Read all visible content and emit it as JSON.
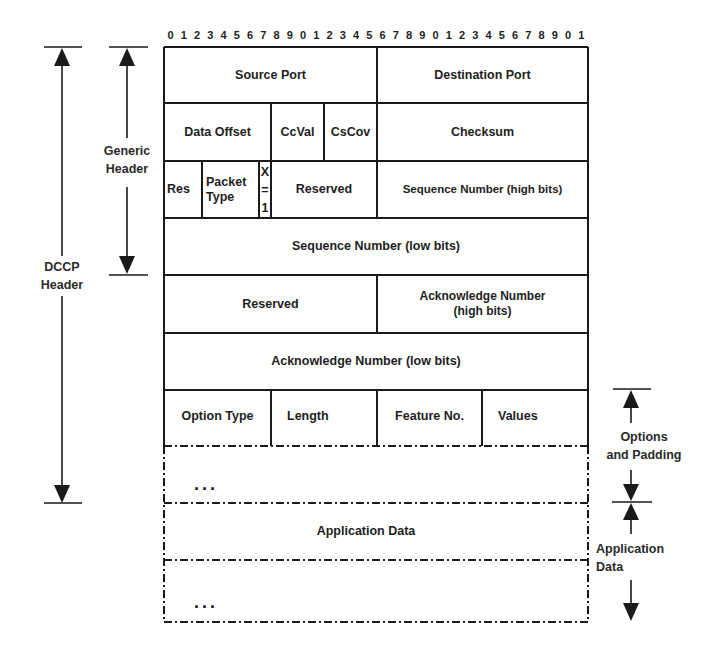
{
  "diagram": {
    "bit_ruler": [
      "0",
      "1",
      "2",
      "3",
      "4",
      "5",
      "6",
      "7",
      "8",
      "9",
      "0",
      "1",
      "2",
      "3",
      "4",
      "5",
      "6",
      "7",
      "8",
      "9",
      "0",
      "1",
      "2",
      "3",
      "4",
      "5",
      "6",
      "7",
      "8",
      "9",
      "0",
      "1"
    ],
    "rows": [
      {
        "fields": [
          {
            "label": "Source Port"
          },
          {
            "label": "Destination Port"
          }
        ]
      },
      {
        "fields": [
          {
            "label": "Data Offset"
          },
          {
            "label": "CcVal"
          },
          {
            "label": "CsCov"
          },
          {
            "label": "Checksum"
          }
        ]
      },
      {
        "fields": [
          {
            "label": "Res"
          },
          {
            "label": "Packet Type"
          },
          {
            "label": "X = 1"
          },
          {
            "label": "Reserved"
          },
          {
            "label": "Sequence Number (high bits)"
          }
        ]
      },
      {
        "fields": [
          {
            "label": "Sequence Number (low bits)"
          }
        ]
      },
      {
        "fields": [
          {
            "label": "Reserved"
          },
          {
            "label": "Acknowledge Number (high bits)"
          }
        ]
      },
      {
        "fields": [
          {
            "label": "Acknowledge Number (low bits)"
          }
        ]
      },
      {
        "fields": [
          {
            "label": "Option Type"
          },
          {
            "label": "Length"
          },
          {
            "label": "Feature No."
          },
          {
            "label": "Values"
          }
        ]
      },
      {
        "fields": [
          {
            "label": "..."
          }
        ]
      },
      {
        "fields": [
          {
            "label": "Application Data"
          }
        ]
      },
      {
        "fields": [
          {
            "label": "..."
          }
        ]
      }
    ],
    "labels": {
      "packet": "Packet",
      "type": "Type",
      "x": "X",
      "eq": "=",
      "one": "1",
      "ack_high_1": "Acknowledge Number",
      "ack_high_2": "(high bits)",
      "ellipsis": "..."
    },
    "annotations": {
      "left": [
        {
          "line1": "DCCP",
          "line2": "Header",
          "span": "rows 1-9 (through options/padding)"
        },
        {
          "line1": "Generic",
          "line2": "Header",
          "span": "rows 1-4"
        }
      ],
      "right": [
        {
          "line1": "Options",
          "line2": "and Padding"
        },
        {
          "line1": "Application",
          "line2": "Data"
        }
      ]
    },
    "colors": {
      "line": "#1a1a1a",
      "background": "#ffffff",
      "text": "#1e1e1e"
    }
  }
}
